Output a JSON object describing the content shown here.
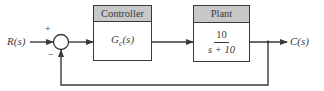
{
  "diagram": {
    "type": "feedback-control-block-diagram",
    "input": {
      "label": "R(s)"
    },
    "output": {
      "label": "C(s)"
    },
    "summing_junction": {
      "plus_sign": "+",
      "minus_sign": "−"
    },
    "blocks": [
      {
        "title": "Controller",
        "transfer_function": {
          "text": "G",
          "subscript": "c",
          "suffix": "(s)"
        }
      },
      {
        "title": "Plant",
        "transfer_function": {
          "numerator": "10",
          "denominator": "s + 10"
        }
      }
    ],
    "feedback": {
      "type": "unity negative feedback"
    },
    "colors": {
      "line": "#3a3a3a",
      "header_fill": "#c8c8c8",
      "background": "#ffffff"
    }
  }
}
